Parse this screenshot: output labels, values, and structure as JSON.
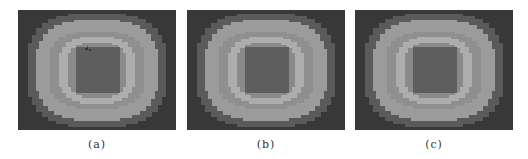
{
  "figure": {
    "panels": [
      {
        "id": "a",
        "caption": "(a)",
        "left": 18,
        "has_mark": true
      },
      {
        "id": "b",
        "caption": "(b)",
        "left": 187,
        "has_mark": false
      },
      {
        "id": "c",
        "caption": "(c)",
        "left": 355,
        "has_mark": false
      }
    ],
    "levels": {
      "background": "#383838",
      "outer_band": "#5a5a5a",
      "wide_band": "#9b9b9b",
      "mid_band": "#8c8c8c",
      "bright_ring": "#adadad",
      "inner_fill": "#8a8a8a",
      "center_core": "#5e5e5e"
    }
  }
}
